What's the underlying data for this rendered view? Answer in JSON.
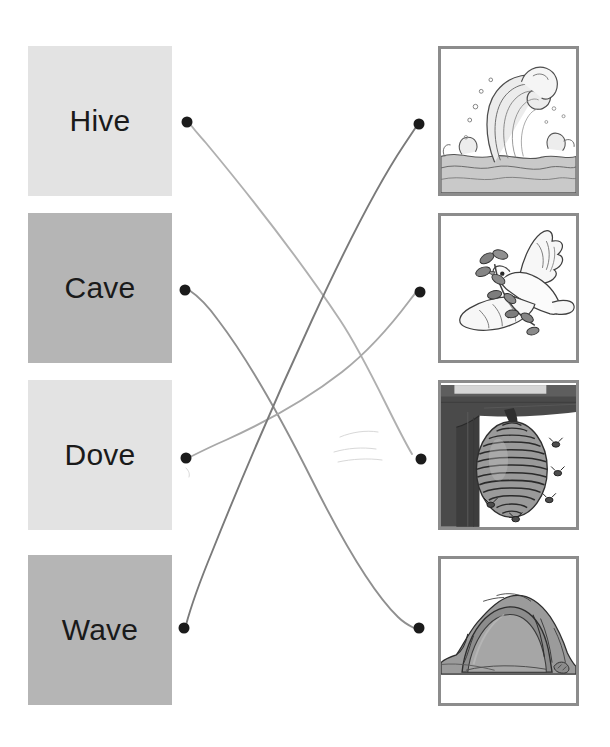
{
  "worksheet": {
    "type": "match-the-word-to-the-picture",
    "canvas": {
      "width": 610,
      "height": 747,
      "background": "#ffffff"
    }
  },
  "words": [
    {
      "id": "hive",
      "label": "Hive",
      "tile_color": "#e3e3e3",
      "text_color": "#1a1a1a",
      "x": 28,
      "y": 46,
      "width": 144,
      "height": 150
    },
    {
      "id": "cave",
      "label": "Cave",
      "tile_color": "#b5b5b5",
      "text_color": "#1a1a1a",
      "x": 28,
      "y": 213,
      "width": 144,
      "height": 150
    },
    {
      "id": "dove",
      "label": "Dove",
      "tile_color": "#e3e3e3",
      "text_color": "#1a1a1a",
      "x": 28,
      "y": 380,
      "width": 144,
      "height": 150
    },
    {
      "id": "wave",
      "label": "Wave",
      "tile_color": "#b5b5b5",
      "text_color": "#1a1a1a",
      "x": 28,
      "y": 555,
      "width": 144,
      "height": 150
    }
  ],
  "pictures": [
    {
      "id": "pic-wave",
      "alt": "wave-illustration",
      "icon": "wave-icon",
      "border_color": "#8c8c8c",
      "x": 438,
      "y": 46,
      "width": 141,
      "height": 150
    },
    {
      "id": "pic-dove",
      "alt": "dove-with-olive-branch-illustration",
      "icon": "dove-icon",
      "border_color": "#8c8c8c",
      "x": 438,
      "y": 213,
      "width": 141,
      "height": 150
    },
    {
      "id": "pic-hive",
      "alt": "beehive-with-bees-illustration",
      "icon": "beehive-icon",
      "border_color": "#8c8c8c",
      "x": 438,
      "y": 380,
      "width": 141,
      "height": 150
    },
    {
      "id": "pic-cave",
      "alt": "cave-entrance-illustration",
      "icon": "cave-icon",
      "border_color": "#8c8c8c",
      "x": 438,
      "y": 556,
      "width": 141,
      "height": 150
    }
  ],
  "left_dots": [
    {
      "id": "dot-hive",
      "row": "hive",
      "cx": 187,
      "cy": 122,
      "r": 5.5,
      "color": "#1b1b1b"
    },
    {
      "id": "dot-cave",
      "row": "cave",
      "cx": 185,
      "cy": 290,
      "r": 5.5,
      "color": "#1b1b1b"
    },
    {
      "id": "dot-dove",
      "row": "dove",
      "cx": 186,
      "cy": 458,
      "r": 5.5,
      "color": "#1b1b1b"
    },
    {
      "id": "dot-wave",
      "row": "wave",
      "cx": 184,
      "cy": 628,
      "r": 5.5,
      "color": "#1b1b1b"
    }
  ],
  "right_dots": [
    {
      "id": "dot-pic-wave",
      "row": "pic-wave",
      "cx": 419,
      "cy": 124,
      "r": 5.5,
      "color": "#1b1b1b"
    },
    {
      "id": "dot-pic-dove",
      "row": "pic-dove",
      "cx": 420,
      "cy": 292,
      "r": 5.5,
      "color": "#1b1b1b"
    },
    {
      "id": "dot-pic-hive",
      "row": "pic-hive",
      "cx": 421,
      "cy": 459,
      "r": 5.5,
      "color": "#1b1b1b"
    },
    {
      "id": "dot-pic-cave",
      "row": "pic-cave",
      "cx": 419,
      "cy": 628,
      "r": 5.5,
      "color": "#1b1b1b"
    }
  ],
  "connections": [
    {
      "id": "link-hive",
      "from": "hive",
      "to": "pic-hive",
      "stroke": "#b0b0b0",
      "width": 1.9,
      "path": "M 190 124 C 196 132, 200 136, 206 143 C 250 196, 300 260, 340 320 C 368 362, 392 420, 412 454"
    },
    {
      "id": "link-cave",
      "from": "cave",
      "to": "pic-cave",
      "stroke": "#8f8f8f",
      "width": 1.9,
      "path": "M 189 290 C 198 296, 208 306, 218 320 C 250 362, 282 420, 312 480 C 342 540, 372 592, 398 617 C 404 623, 410 626, 414 628"
    },
    {
      "id": "link-dove",
      "from": "dove",
      "to": "pic-dove",
      "stroke": "#a8a8a8",
      "width": 1.9,
      "path": "M 190 457 C 200 452, 212 446, 226 440 C 266 422, 306 400, 342 372 C 374 347, 398 316, 410 300 C 413 296, 415 294, 416 292"
    },
    {
      "id": "link-wave",
      "from": "wave",
      "to": "pic-wave",
      "stroke": "#7a7a7a",
      "width": 1.9,
      "path": "M 186 625 C 190 610, 198 586, 212 552 C 240 482, 276 398, 312 320 C 348 242, 382 178, 404 145 C 410 136, 414 130, 416 127"
    }
  ],
  "erased_marks": [
    {
      "id": "smudge-1",
      "path": "M 340 437 C 352 432, 366 430, 378 432"
    },
    {
      "id": "smudge-2",
      "path": "M 334 452 C 348 448, 362 447, 376 449"
    },
    {
      "id": "smudge-3",
      "path": "M 338 462 C 352 459, 368 458, 382 460"
    },
    {
      "id": "smudge-4",
      "path": "M 186 468 C 189 471, 190 474, 189 477"
    }
  ]
}
